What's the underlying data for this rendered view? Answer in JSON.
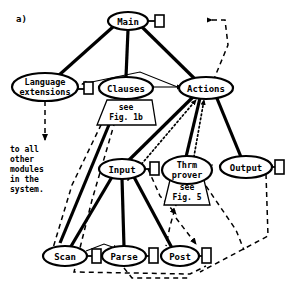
{
  "figure": {
    "panel_label": "a)",
    "background": "#ffffff",
    "ink": "#000000"
  },
  "nodes": [
    {
      "id": "main",
      "label": "Main",
      "cx": 128,
      "cy": 21,
      "rx": 20,
      "ry": 9,
      "port_right": true
    },
    {
      "id": "langext",
      "label": "Language",
      "label2": "extensions",
      "cx": 45,
      "cy": 87,
      "rx": 33,
      "ry": 13,
      "port_right": true
    },
    {
      "id": "clauses",
      "label": "Clauses",
      "cx": 126,
      "cy": 87,
      "rx": 26,
      "ry": 10,
      "port_right": false
    },
    {
      "id": "actions",
      "label": "Actions",
      "cx": 206,
      "cy": 88,
      "rx": 26,
      "ry": 10,
      "port_right": false
    },
    {
      "id": "input",
      "label": "Input",
      "cx": 122,
      "cy": 169,
      "rx": 22,
      "ry": 9,
      "port_right": true
    },
    {
      "id": "thrmprover",
      "label": "Thrm",
      "label2": "prover",
      "cx": 187,
      "cy": 170,
      "rx": 24,
      "ry": 13,
      "port_right": false
    },
    {
      "id": "output",
      "label": "Output",
      "cx": 246,
      "cy": 167,
      "rx": 25,
      "ry": 10,
      "port_right": true
    },
    {
      "id": "scan",
      "label": "Scan",
      "cx": 65,
      "cy": 256,
      "rx": 21,
      "ry": 9,
      "port_right": true
    },
    {
      "id": "parse",
      "label": "Parse",
      "cx": 124,
      "cy": 256,
      "rx": 21,
      "ry": 9,
      "port_right": true
    },
    {
      "id": "post",
      "label": "Post",
      "cx": 180,
      "cy": 256,
      "rx": 18,
      "ry": 9,
      "port_right": true
    }
  ],
  "annotations": [
    {
      "id": "see-fig-1b",
      "lines": [
        "see",
        "Fig. 1b"
      ],
      "x": 112,
      "y": 112,
      "shape": "trapezoid"
    },
    {
      "id": "see-fig-5",
      "lines": [
        "see",
        "Fig. 5"
      ],
      "x": 178,
      "y": 191,
      "shape": "trapezoid"
    }
  ],
  "free_text": {
    "to_all_modules": [
      "to all",
      "other",
      "modules",
      "in the",
      "system."
    ],
    "to_all_modules_x": 10,
    "to_all_modules_y": 148
  },
  "legend_note": "Solid thick = calls, thin = uses, dashed = data flow, dotted = control"
}
